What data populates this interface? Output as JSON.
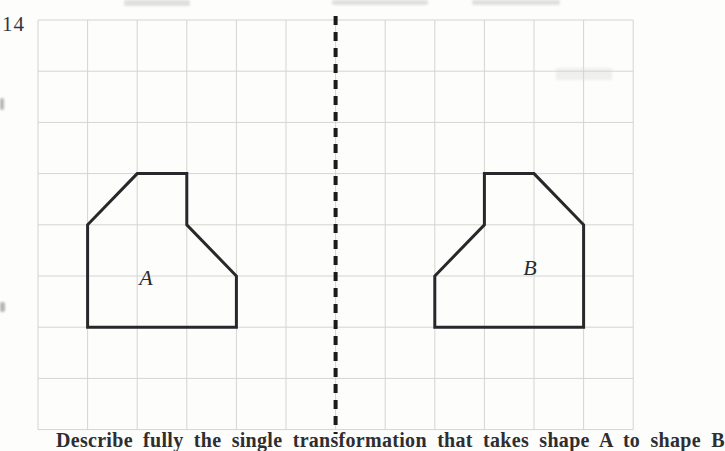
{
  "figure": {
    "question_number": "14",
    "grid": {
      "x0": 38,
      "y0": 20,
      "cols": 12,
      "rows": 8,
      "cell_w": 49.6,
      "cell_h": 51.2,
      "line_color": "#d4d4d0",
      "background": "#fdfdfc"
    },
    "mirror_line": {
      "x_grid": 6,
      "y_top": 16,
      "y_bottom": 434,
      "color": "#1b1b1e",
      "width": 4,
      "dash": "9 7"
    },
    "shape_stroke": {
      "color": "#28282c",
      "width": 3
    },
    "shapes": [
      {
        "label": "A",
        "vertices_grid": [
          [
            2,
            3
          ],
          [
            3,
            3
          ],
          [
            3,
            4
          ],
          [
            4,
            5
          ],
          [
            4,
            6
          ],
          [
            1,
            6
          ],
          [
            1,
            4
          ]
        ],
        "label_pos": [
          146,
          278
        ]
      },
      {
        "label": "B",
        "vertices_grid": [
          [
            9,
            3
          ],
          [
            10,
            3
          ],
          [
            11,
            4
          ],
          [
            11,
            6
          ],
          [
            8,
            6
          ],
          [
            8,
            5
          ],
          [
            9,
            4
          ]
        ],
        "label_pos": [
          530,
          268
        ]
      }
    ]
  },
  "caption": {
    "text": "Describe fully the single transformation that takes shape A to shape B",
    "clipped": true
  }
}
